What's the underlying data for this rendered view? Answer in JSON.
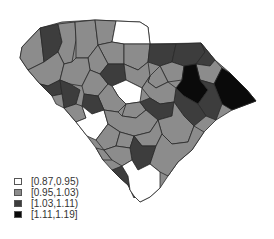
{
  "map": {
    "region": "South Carolina counties",
    "stroke_color": "#2a2a2a",
    "classes": [
      {
        "label": "[0.87,0.95)",
        "color": "#ffffff"
      },
      {
        "label": "[0.95,1.03)",
        "color": "#8c8c8c"
      },
      {
        "label": "[1.03,1.11)",
        "color": "#3d3d3d"
      },
      {
        "label": "[1.11,1.19]",
        "color": "#0a0a0a"
      }
    ]
  },
  "legend": {
    "items": [
      {
        "label": "[0.87,0.95)",
        "color": "#ffffff"
      },
      {
        "label": "[0.95,1.03)",
        "color": "#8c8c8c"
      },
      {
        "label": "[1.03,1.11)",
        "color": "#3d3d3d"
      },
      {
        "label": "[1.11,1.19]",
        "color": "#0a0a0a"
      }
    ]
  }
}
